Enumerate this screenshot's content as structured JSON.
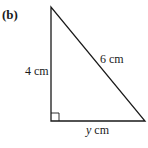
{
  "figure": {
    "part_label": "(b)",
    "shape": "right-triangle",
    "vertices": {
      "top": [
        51,
        7
      ],
      "right_angle": [
        51,
        121
      ],
      "bottom_right": [
        145,
        121
      ]
    },
    "right_angle_marker": true,
    "stroke_color": "#1a1a1a",
    "sides": {
      "vertical": {
        "label": "4 cm",
        "value": 4,
        "unit": "cm"
      },
      "hypotenuse": {
        "label": "6 cm",
        "value": 6,
        "unit": "cm"
      },
      "base": {
        "variable": "y",
        "unit_text": " cm",
        "unit": "cm"
      }
    }
  }
}
